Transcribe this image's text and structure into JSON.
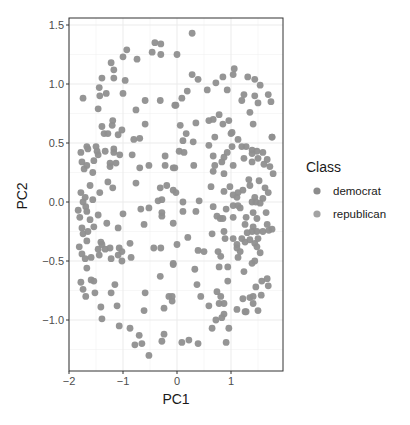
{
  "chart_data": {
    "type": "scatter",
    "title": "",
    "xlabel": "PC1",
    "ylabel": "PC2",
    "xlim": [
      -2.0,
      1.96
    ],
    "ylim": [
      -1.43,
      1.56
    ],
    "x_ticks": [
      -2,
      -1,
      0,
      1
    ],
    "x_tick_labels": [
      "−2",
      "−1",
      "0",
      "1"
    ],
    "y_ticks": [
      -1.0,
      -0.5,
      0.0,
      0.5,
      1.0,
      1.5
    ],
    "y_tick_labels": [
      "−1.0",
      "−0.5",
      "0.0",
      "0.5",
      "1.0",
      "1.5"
    ],
    "grid": true,
    "legend": {
      "title": "Class",
      "placement": "right",
      "entries": [
        {
          "label": "democrat",
          "color": "#8c8c8c"
        },
        {
          "label": "republican",
          "color": "#a3a3a3"
        }
      ]
    },
    "point_color": "#8f8f8f",
    "points": [
      [
        -0.41,
        1.35
      ],
      [
        -0.3,
        1.34
      ],
      [
        -0.46,
        1.27
      ],
      [
        -0.3,
        1.25
      ],
      [
        -0.93,
        1.29
      ],
      [
        -1.0,
        1.23
      ],
      [
        -0.74,
        1.21
      ],
      [
        -1.22,
        1.18
      ],
      [
        -1.17,
        1.12
      ],
      [
        -1.39,
        1.05
      ],
      [
        -1.17,
        1.05
      ],
      [
        -0.96,
        1.03
      ],
      [
        -1.44,
        0.97
      ],
      [
        -1.43,
        0.9
      ],
      [
        -1.31,
        0.92
      ],
      [
        -1.74,
        0.88
      ],
      [
        -1.0,
        0.92
      ],
      [
        -0.59,
        0.86
      ],
      [
        -0.31,
        0.86
      ],
      [
        -0.04,
        0.82
      ],
      [
        -1.46,
        0.79
      ],
      [
        -0.76,
        0.78
      ],
      [
        -1.19,
        0.69
      ],
      [
        -1.39,
        0.64
      ],
      [
        -1.2,
        0.65
      ],
      [
        -0.59,
        0.66
      ],
      [
        -1.02,
        0.61
      ],
      [
        0.28,
        1.43
      ],
      [
        0.0,
        1.25
      ],
      [
        1.06,
        1.13
      ],
      [
        1.04,
        1.08
      ],
      [
        0.28,
        1.08
      ],
      [
        0.39,
        1.04
      ],
      [
        0.85,
        1.06
      ],
      [
        0.72,
        1.01
      ],
      [
        1.31,
        1.06
      ],
      [
        1.44,
        1.04
      ],
      [
        1.54,
        0.99
      ],
      [
        0.19,
        0.94
      ],
      [
        0.56,
        0.95
      ],
      [
        0.93,
        0.95
      ],
      [
        0.09,
        0.88
      ],
      [
        -0.02,
        0.82
      ],
      [
        1.24,
        0.91
      ],
      [
        1.2,
        0.86
      ],
      [
        1.44,
        0.9
      ],
      [
        1.69,
        0.91
      ],
      [
        1.74,
        0.85
      ],
      [
        1.5,
        0.84
      ],
      [
        1.35,
        0.76
      ],
      [
        0.78,
        0.74
      ],
      [
        0.59,
        0.69
      ],
      [
        0.67,
        0.7
      ],
      [
        0.96,
        0.69
      ],
      [
        0.85,
        0.66
      ],
      [
        0.35,
        0.67
      ],
      [
        0.06,
        0.65
      ],
      [
        1.41,
        0.66
      ],
      [
        0.17,
        0.58
      ],
      [
        1.02,
        0.59
      ],
      [
        -1.35,
        0.58
      ],
      [
        -1.28,
        0.58
      ],
      [
        -1.09,
        0.57
      ],
      [
        -0.8,
        0.53
      ],
      [
        -0.69,
        0.54
      ],
      [
        -1.67,
        0.47
      ],
      [
        -1.5,
        0.47
      ],
      [
        -1.78,
        0.42
      ],
      [
        -1.65,
        0.45
      ],
      [
        -1.48,
        0.43
      ],
      [
        -1.33,
        0.43
      ],
      [
        -1.17,
        0.45
      ],
      [
        -1.17,
        0.42
      ],
      [
        -1.06,
        0.4
      ],
      [
        -1.46,
        0.4
      ],
      [
        -1.54,
        0.35
      ],
      [
        -1.76,
        0.34
      ],
      [
        -0.83,
        0.4
      ],
      [
        -0.22,
        0.39
      ],
      [
        -1.24,
        0.33
      ],
      [
        -1.13,
        0.33
      ],
      [
        -1.24,
        0.3
      ],
      [
        -1.67,
        0.31
      ],
      [
        -1.72,
        0.28
      ],
      [
        -1.56,
        0.25
      ],
      [
        -0.69,
        0.29
      ],
      [
        -0.52,
        0.31
      ],
      [
        -0.22,
        0.31
      ],
      [
        -0.07,
        0.29
      ],
      [
        -1.28,
        0.17
      ],
      [
        -1.61,
        0.14
      ],
      [
        -1.19,
        0.12
      ],
      [
        -0.76,
        0.16
      ],
      [
        -1.78,
        0.08
      ],
      [
        -1.43,
        0.08
      ],
      [
        -0.31,
        0.12
      ],
      [
        -0.19,
        0.14
      ],
      [
        -0.07,
        0.1
      ],
      [
        -1.7,
        0.04
      ],
      [
        -1.74,
        0.0
      ],
      [
        -1.56,
        0.02
      ],
      [
        -1.69,
        -0.04
      ],
      [
        -1.83,
        -0.07
      ],
      [
        -1.67,
        -0.08
      ],
      [
        -1.8,
        -0.13
      ],
      [
        -1.61,
        -0.15
      ],
      [
        -1.46,
        -0.11
      ],
      [
        -1.0,
        -0.1
      ],
      [
        -0.67,
        -0.06
      ],
      [
        -0.52,
        -0.05
      ],
      [
        -0.35,
        0.01
      ],
      [
        -0.28,
        0.02
      ],
      [
        -0.28,
        -0.09
      ],
      [
        -0.28,
        -0.12
      ],
      [
        -1.3,
        -0.18
      ],
      [
        -1.09,
        -0.22
      ],
      [
        -0.61,
        -0.19
      ],
      [
        -0.07,
        -0.18
      ],
      [
        0.11,
        0.52
      ],
      [
        0.3,
        0.51
      ],
      [
        0.7,
        0.55
      ],
      [
        1.0,
        0.58
      ],
      [
        1.13,
        0.53
      ],
      [
        1.76,
        0.55
      ],
      [
        0.59,
        0.48
      ],
      [
        1.02,
        0.47
      ],
      [
        1.2,
        0.47
      ],
      [
        1.28,
        0.47
      ],
      [
        0.04,
        0.43
      ],
      [
        0.13,
        0.42
      ],
      [
        0.67,
        0.39
      ],
      [
        0.93,
        0.42
      ],
      [
        0.87,
        0.38
      ],
      [
        1.39,
        0.44
      ],
      [
        1.48,
        0.43
      ],
      [
        1.39,
        0.41
      ],
      [
        1.59,
        0.42
      ],
      [
        1.24,
        0.37
      ],
      [
        1.5,
        0.37
      ],
      [
        1.67,
        0.36
      ],
      [
        0.83,
        0.34
      ],
      [
        0.7,
        0.31
      ],
      [
        1.04,
        0.31
      ],
      [
        1.39,
        0.34
      ],
      [
        1.61,
        0.32
      ],
      [
        1.72,
        0.3
      ],
      [
        -0.04,
        0.29
      ],
      [
        0.31,
        0.31
      ],
      [
        0.67,
        0.26
      ],
      [
        0.87,
        0.24
      ],
      [
        1.78,
        0.24
      ],
      [
        1.33,
        0.19
      ],
      [
        1.52,
        0.18
      ],
      [
        0.63,
        0.13
      ],
      [
        0.98,
        0.13
      ],
      [
        1.35,
        0.14
      ],
      [
        1.63,
        0.12
      ],
      [
        0.87,
        0.09
      ],
      [
        1.22,
        0.1
      ],
      [
        1.13,
        0.08
      ],
      [
        -0.02,
        0.08
      ],
      [
        1.69,
        0.08
      ],
      [
        1.04,
        0.06
      ],
      [
        1.11,
        0.04
      ],
      [
        1.44,
        0.04
      ],
      [
        1.59,
        0.03
      ],
      [
        0.11,
        0.0
      ],
      [
        0.41,
        0.01
      ],
      [
        1.39,
        0.0
      ],
      [
        1.46,
        0.0
      ],
      [
        1.54,
        -0.01
      ],
      [
        1.04,
        -0.03
      ],
      [
        1.13,
        -0.03
      ],
      [
        0.67,
        -0.04
      ],
      [
        0.91,
        -0.06
      ],
      [
        1.17,
        -0.05
      ],
      [
        0.11,
        -0.08
      ],
      [
        0.35,
        -0.08
      ],
      [
        1.41,
        -0.09
      ],
      [
        1.65,
        -0.09
      ],
      [
        0.74,
        -0.12
      ],
      [
        0.8,
        -0.14
      ],
      [
        0.85,
        -0.14
      ],
      [
        1.04,
        -0.13
      ],
      [
        1.28,
        -0.13
      ],
      [
        1.48,
        -0.14
      ],
      [
        1.76,
        -0.23
      ],
      [
        1.26,
        -0.19
      ],
      [
        1.41,
        -0.21
      ],
      [
        1.67,
        -0.19
      ],
      [
        1.76,
        0.55
      ],
      [
        -1.76,
        -0.22
      ],
      [
        -1.54,
        -0.21
      ],
      [
        -1.74,
        -0.27
      ],
      [
        -1.65,
        -0.25
      ],
      [
        -1.67,
        -0.33
      ],
      [
        -1.41,
        -0.34
      ],
      [
        -1.39,
        -0.36
      ],
      [
        -0.87,
        -0.35
      ],
      [
        -1.81,
        -0.38
      ],
      [
        -1.46,
        -0.4
      ],
      [
        -1.33,
        -0.4
      ],
      [
        -1.24,
        -0.39
      ],
      [
        -1.07,
        -0.39
      ],
      [
        -1.02,
        -0.42
      ],
      [
        -1.76,
        -0.44
      ],
      [
        -1.44,
        -0.45
      ],
      [
        -1.09,
        -0.45
      ],
      [
        -0.85,
        -0.47
      ],
      [
        -0.43,
        -0.39
      ],
      [
        -0.3,
        -0.39
      ],
      [
        -1.7,
        -0.48
      ],
      [
        -1.59,
        -0.47
      ],
      [
        -1.22,
        -0.48
      ],
      [
        -1.02,
        -0.5
      ],
      [
        -1.67,
        -0.56
      ],
      [
        -0.07,
        -0.52
      ],
      [
        -0.31,
        -0.63
      ],
      [
        -1.59,
        -0.66
      ],
      [
        -1.54,
        -0.67
      ],
      [
        -1.78,
        -0.68
      ],
      [
        -1.15,
        -0.7
      ],
      [
        -1.74,
        -0.74
      ],
      [
        -1.52,
        -0.77
      ],
      [
        -1.22,
        -0.77
      ],
      [
        -0.59,
        -0.77
      ],
      [
        -1.69,
        -0.8
      ],
      [
        -0.15,
        -0.8
      ],
      [
        -0.09,
        -0.84
      ],
      [
        -1.41,
        -0.89
      ],
      [
        -1.11,
        -0.88
      ],
      [
        -0.61,
        -0.92
      ],
      [
        -0.24,
        -0.9
      ],
      [
        -1.39,
        -0.99
      ],
      [
        -1.07,
        -1.05
      ],
      [
        -0.87,
        -1.07
      ],
      [
        -0.7,
        -1.13
      ],
      [
        -0.78,
        -1.21
      ],
      [
        -0.65,
        -1.2
      ],
      [
        -0.24,
        -1.12
      ],
      [
        -0.28,
        -1.18
      ],
      [
        -0.52,
        -1.3
      ],
      [
        0.09,
        -1.19
      ],
      [
        0.22,
        -1.17
      ],
      [
        0.39,
        -1.2
      ],
      [
        0.65,
        -0.27
      ],
      [
        0.87,
        -0.25
      ],
      [
        0.89,
        -0.31
      ],
      [
        0.2,
        -0.3
      ],
      [
        0.0,
        -0.36
      ],
      [
        1.04,
        -0.31
      ],
      [
        1.11,
        -0.36
      ],
      [
        1.11,
        -0.39
      ],
      [
        1.2,
        -0.31
      ],
      [
        1.3,
        -0.26
      ],
      [
        1.39,
        -0.25
      ],
      [
        1.48,
        -0.25
      ],
      [
        1.59,
        -0.25
      ],
      [
        1.7,
        -0.24
      ],
      [
        1.26,
        -0.34
      ],
      [
        1.35,
        -0.32
      ],
      [
        1.44,
        -0.35
      ],
      [
        1.5,
        -0.31
      ],
      [
        1.48,
        -0.38
      ],
      [
        1.17,
        -0.42
      ],
      [
        1.13,
        -0.47
      ],
      [
        1.54,
        -0.43
      ],
      [
        0.39,
        -0.41
      ],
      [
        0.5,
        -0.42
      ],
      [
        0.76,
        -0.42
      ],
      [
        0.81,
        -0.46
      ],
      [
        -0.07,
        -0.53
      ],
      [
        1.39,
        -0.52
      ],
      [
        1.44,
        -0.5
      ],
      [
        0.78,
        -0.55
      ],
      [
        0.94,
        -0.55
      ],
      [
        0.33,
        -0.57
      ],
      [
        1.24,
        -0.59
      ],
      [
        1.57,
        -0.67
      ],
      [
        1.67,
        -0.65
      ],
      [
        1.69,
        -0.71
      ],
      [
        0.94,
        -0.67
      ],
      [
        1.46,
        -0.72
      ],
      [
        0.37,
        -0.7
      ],
      [
        -0.09,
        -0.8
      ],
      [
        0.44,
        -0.8
      ],
      [
        0.74,
        -0.76
      ],
      [
        0.81,
        -0.8
      ],
      [
        1.22,
        -0.82
      ],
      [
        1.35,
        -0.81
      ],
      [
        1.41,
        -0.8
      ],
      [
        1.56,
        -0.79
      ],
      [
        1.41,
        -0.86
      ],
      [
        0.59,
        -0.88
      ],
      [
        0.78,
        -0.86
      ],
      [
        0.87,
        -0.86
      ],
      [
        1.11,
        -0.91
      ],
      [
        1.26,
        -0.93
      ],
      [
        1.5,
        -0.92
      ],
      [
        0.87,
        -0.95
      ],
      [
        0.83,
        -0.98
      ],
      [
        0.72,
        -1.0
      ],
      [
        0.65,
        -1.07
      ],
      [
        0.96,
        -1.07
      ],
      [
        0.91,
        -1.19
      ],
      [
        1.28,
        -0.93
      ]
    ]
  }
}
